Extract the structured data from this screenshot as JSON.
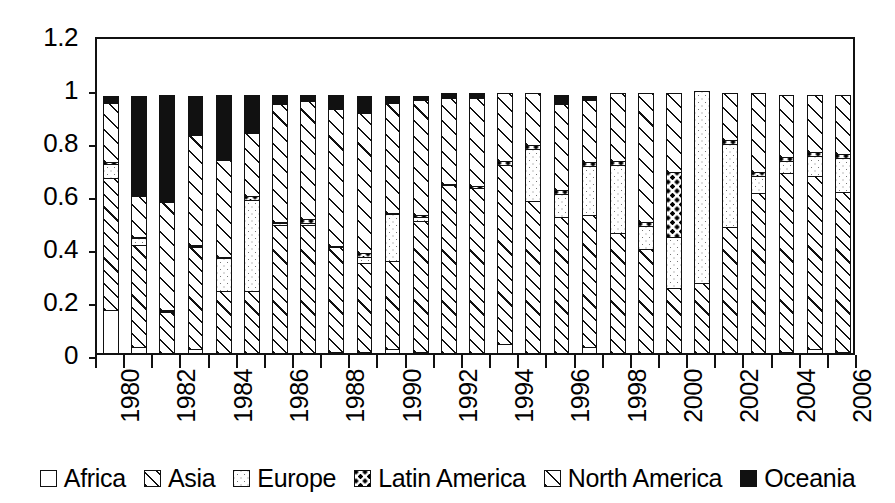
{
  "chart_data": {
    "type": "bar",
    "subtype": "stacked-bar-100pct",
    "title": "",
    "xlabel": "",
    "ylabel": "",
    "ylim": [
      0,
      1.2
    ],
    "ytick_labels": [
      "0",
      "0.2",
      "0.4",
      "0.6",
      "0.8",
      "1",
      "1.2"
    ],
    "ytick_values": [
      0,
      0.2,
      0.4,
      0.6,
      0.8,
      1,
      1.2
    ],
    "grid": false,
    "legend_position": "bottom",
    "categories": [
      "1980",
      "1981",
      "1982",
      "1983",
      "1984",
      "1985",
      "1986",
      "1987",
      "1988",
      "1989",
      "1990",
      "1991",
      "1992",
      "1993",
      "1994",
      "1995",
      "1996",
      "1997",
      "1998",
      "1999",
      "2000",
      "2001",
      "2002",
      "2003",
      "2004",
      "2005",
      "2006"
    ],
    "xtick_labels_shown": [
      "1980",
      "",
      "1982",
      "",
      "1984",
      "",
      "1986",
      "",
      "1988",
      "",
      "1990",
      "",
      "1992",
      "",
      "1994",
      "",
      "1996",
      "",
      "1998",
      "",
      "2000",
      "",
      "2002",
      "",
      "2004",
      "",
      "2006"
    ],
    "series": [
      {
        "name": "Africa",
        "pattern": "open-white",
        "values": [
          0.17,
          0.03,
          0.0,
          0.02,
          0.0,
          0.0,
          0.0,
          0.0,
          0.01,
          0.01,
          0.02,
          0.01,
          0.0,
          0.0,
          0.04,
          0.0,
          0.0,
          0.03,
          0.0,
          0.0,
          0.0,
          0.0,
          0.0,
          0.0,
          0.01,
          0.02,
          0.01
        ]
      },
      {
        "name": "Asia",
        "pattern": "dense-diagonal-hatch",
        "values": [
          0.5,
          0.39,
          0.16,
          0.39,
          0.24,
          0.24,
          0.49,
          0.49,
          0.4,
          0.34,
          0.34,
          0.5,
          0.64,
          0.63,
          0.68,
          0.58,
          0.52,
          0.5,
          0.46,
          0.4,
          0.25,
          0.27,
          0.48,
          0.61,
          0.68,
          0.66,
          0.61
        ]
      },
      {
        "name": "Europe",
        "pattern": "fine-dots",
        "values": [
          0.06,
          0.03,
          0.01,
          0.01,
          0.13,
          0.35,
          0.01,
          0.01,
          0.0,
          0.03,
          0.18,
          0.02,
          0.0,
          0.0,
          0.0,
          0.2,
          0.09,
          0.19,
          0.26,
          0.09,
          0.2,
          0.73,
          0.32,
          0.07,
          0.05,
          0.08,
          0.13
        ]
      },
      {
        "name": "Latin America",
        "pattern": "bold-dots",
        "values": [
          0.01,
          0.01,
          0.01,
          0.01,
          0.01,
          0.02,
          0.01,
          0.02,
          0.01,
          0.02,
          0.01,
          0.01,
          0.01,
          0.01,
          0.02,
          0.02,
          0.02,
          0.02,
          0.02,
          0.02,
          0.25,
          0.0,
          0.02,
          0.02,
          0.02,
          0.02,
          0.02
        ]
      },
      {
        "name": "North America",
        "pattern": "sparse-diagonal-hatch",
        "values": [
          0.23,
          0.16,
          0.41,
          0.42,
          0.37,
          0.24,
          0.45,
          0.45,
          0.52,
          0.53,
          0.42,
          0.44,
          0.33,
          0.34,
          0.26,
          0.2,
          0.33,
          0.24,
          0.26,
          0.49,
          0.3,
          0.0,
          0.18,
          0.3,
          0.24,
          0.22,
          0.23
        ]
      },
      {
        "name": "Oceania",
        "pattern": "solid-black",
        "values": [
          0.03,
          0.38,
          0.41,
          0.15,
          0.25,
          0.15,
          0.04,
          0.03,
          0.06,
          0.07,
          0.03,
          0.02,
          0.02,
          0.02,
          0.0,
          0.0,
          0.04,
          0.02,
          0.0,
          0.0,
          0.0,
          0.0,
          0.0,
          0.0,
          0.0,
          0.0,
          0.0
        ]
      }
    ],
    "colors": {
      "ink": "#111111",
      "fill": "#ffffff",
      "oceania": "#000000"
    }
  },
  "legend": {
    "items": [
      {
        "label": "Africa",
        "pattern": "open-white"
      },
      {
        "label": "Asia",
        "pattern": "dense-diagonal-hatch"
      },
      {
        "label": "Europe",
        "pattern": "fine-dots"
      },
      {
        "label": "Latin America",
        "pattern": "bold-dots"
      },
      {
        "label": "North America",
        "pattern": "sparse-diagonal-hatch"
      },
      {
        "label": "Oceania",
        "pattern": "solid-black"
      }
    ]
  }
}
